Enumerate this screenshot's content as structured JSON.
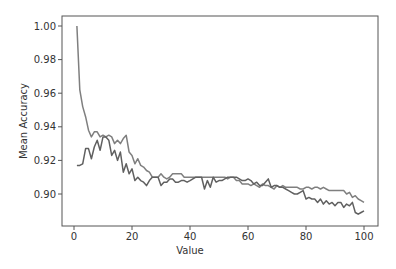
{
  "chart_data": {
    "type": "line",
    "title": "",
    "xlabel": "Value",
    "ylabel": "Mean Accuracy",
    "xlim": [
      -4,
      105
    ],
    "ylim": [
      0.8815,
      1.006
    ],
    "grid": false,
    "legend": null,
    "x_ticks": [
      0,
      20,
      40,
      60,
      80,
      100
    ],
    "x_tick_labels": [
      "0",
      "20",
      "40",
      "60",
      "80",
      "100"
    ],
    "y_ticks": [
      0.9,
      0.92,
      0.94,
      0.96,
      0.98,
      1.0
    ],
    "y_tick_labels": [
      "0.90",
      "0.92",
      "0.94",
      "0.96",
      "0.98",
      "1.00"
    ],
    "series": [
      {
        "name": "series-1",
        "color": "#7f7f7f",
        "x": [
          1,
          2,
          3,
          4,
          5,
          6,
          7,
          8,
          9,
          10,
          11,
          12,
          13,
          14,
          15,
          16,
          17,
          18,
          19,
          20,
          21,
          22,
          23,
          24,
          25,
          26,
          27,
          28,
          29,
          30,
          31,
          32,
          33,
          34,
          35,
          36,
          37,
          38,
          39,
          40,
          41,
          42,
          43,
          44,
          45,
          46,
          47,
          48,
          49,
          50,
          51,
          52,
          53,
          54,
          55,
          56,
          57,
          58,
          59,
          60,
          61,
          62,
          63,
          64,
          65,
          66,
          67,
          68,
          69,
          70,
          71,
          72,
          73,
          74,
          75,
          76,
          77,
          78,
          79,
          80,
          81,
          82,
          83,
          84,
          85,
          86,
          87,
          88,
          89,
          90,
          91,
          92,
          93,
          94,
          95,
          96,
          97,
          98,
          99,
          100
        ],
        "values": [
          1.0,
          0.962,
          0.952,
          0.946,
          0.938,
          0.934,
          0.937,
          0.937,
          0.934,
          0.935,
          0.934,
          0.935,
          0.934,
          0.93,
          0.932,
          0.93,
          0.933,
          0.935,
          0.925,
          0.923,
          0.918,
          0.921,
          0.917,
          0.916,
          0.914,
          0.913,
          0.91,
          0.91,
          0.91,
          0.912,
          0.91,
          0.909,
          0.91,
          0.912,
          0.912,
          0.912,
          0.912,
          0.91,
          0.91,
          0.91,
          0.91,
          0.91,
          0.91,
          0.91,
          0.91,
          0.91,
          0.91,
          0.91,
          0.91,
          0.91,
          0.91,
          0.91,
          0.909,
          0.91,
          0.91,
          0.908,
          0.908,
          0.906,
          0.906,
          0.906,
          0.905,
          0.906,
          0.905,
          0.904,
          0.906,
          0.905,
          0.905,
          0.904,
          0.903,
          0.905,
          0.904,
          0.905,
          0.904,
          0.904,
          0.904,
          0.904,
          0.904,
          0.903,
          0.903,
          0.904,
          0.904,
          0.903,
          0.904,
          0.904,
          0.903,
          0.904,
          0.903,
          0.902,
          0.902,
          0.902,
          0.902,
          0.902,
          0.902,
          0.9,
          0.901,
          0.898,
          0.899,
          0.897,
          0.896,
          0.895
        ]
      },
      {
        "name": "series-2",
        "color": "#606060",
        "x": [
          1,
          2,
          3,
          4,
          5,
          6,
          7,
          8,
          9,
          10,
          11,
          12,
          13,
          14,
          15,
          16,
          17,
          18,
          19,
          20,
          21,
          22,
          23,
          24,
          25,
          26,
          27,
          28,
          29,
          30,
          31,
          32,
          33,
          34,
          35,
          36,
          37,
          38,
          39,
          40,
          41,
          42,
          43,
          44,
          45,
          46,
          47,
          48,
          49,
          50,
          51,
          52,
          53,
          54,
          55,
          56,
          57,
          58,
          59,
          60,
          61,
          62,
          63,
          64,
          65,
          66,
          67,
          68,
          69,
          70,
          71,
          72,
          73,
          74,
          75,
          76,
          77,
          78,
          79,
          80,
          81,
          82,
          83,
          84,
          85,
          86,
          87,
          88,
          89,
          90,
          91,
          92,
          93,
          94,
          95,
          96,
          97,
          98,
          99,
          100
        ],
        "values": [
          0.917,
          0.917,
          0.918,
          0.927,
          0.927,
          0.921,
          0.928,
          0.932,
          0.926,
          0.934,
          0.934,
          0.932,
          0.923,
          0.926,
          0.92,
          0.925,
          0.913,
          0.918,
          0.912,
          0.915,
          0.908,
          0.91,
          0.908,
          0.907,
          0.905,
          0.908,
          0.91,
          0.91,
          0.91,
          0.905,
          0.907,
          0.907,
          0.909,
          0.909,
          0.907,
          0.907,
          0.908,
          0.908,
          0.907,
          0.908,
          0.909,
          0.91,
          0.91,
          0.91,
          0.903,
          0.908,
          0.904,
          0.91,
          0.907,
          0.908,
          0.908,
          0.909,
          0.91,
          0.91,
          0.91,
          0.91,
          0.909,
          0.908,
          0.908,
          0.909,
          0.908,
          0.906,
          0.907,
          0.905,
          0.905,
          0.907,
          0.909,
          0.904,
          0.905,
          0.905,
          0.904,
          0.904,
          0.903,
          0.902,
          0.901,
          0.9,
          0.9,
          0.901,
          0.902,
          0.897,
          0.898,
          0.897,
          0.897,
          0.895,
          0.897,
          0.894,
          0.896,
          0.894,
          0.895,
          0.893,
          0.895,
          0.895,
          0.892,
          0.894,
          0.893,
          0.895,
          0.889,
          0.888,
          0.889,
          0.89
        ]
      }
    ]
  }
}
